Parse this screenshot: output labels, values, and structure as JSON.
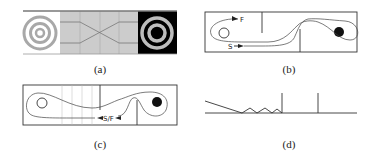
{
  "figure": {
    "panels": [
      {
        "id": "a",
        "caption": "(a)",
        "description": "Grid-cell style strip: white cell with concentric grey rings on left, grey corridor with crossing lines in middle, black cell with grey rings on right"
      },
      {
        "id": "b",
        "caption": "(b)",
        "labels": {
          "forward": "F",
          "start": "S"
        },
        "description": "Arena with open circle (left) and filled circle (right), two partial walls, trajectory looping from S around to F"
      },
      {
        "id": "c",
        "caption": "(c)",
        "labels": {
          "start_finish": "S/F"
        },
        "description": "Arena with open and filled circles, vertical grid lines on left half, closed trajectory loop around filled circle"
      },
      {
        "id": "d",
        "caption": "(d)",
        "description": "Line profile: baseline with descending slope, zigzag segment, and two vertical spikes"
      }
    ]
  },
  "colors": {
    "line": "#333333",
    "grey_fill": "#c8c8c8",
    "ring_grey": "#a8a8a8",
    "black": "#000000",
    "white": "#ffffff"
  }
}
